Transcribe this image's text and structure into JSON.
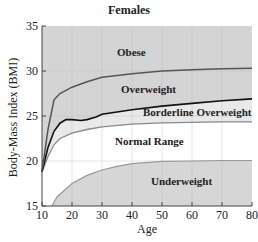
{
  "chart_data": {
    "type": "area",
    "title": "Females",
    "xlabel": "Age",
    "ylabel": "Body-Mass Index (BMI)",
    "xlim": [
      10,
      80
    ],
    "ylim": [
      15,
      35
    ],
    "x_ticks": [
      10,
      20,
      30,
      40,
      50,
      60,
      70,
      80
    ],
    "y_ticks": [
      15,
      20,
      25,
      30,
      35
    ],
    "grid": true,
    "series": [
      {
        "name": "Obese threshold",
        "x": [
          10,
          12,
          14,
          16,
          20,
          25,
          30,
          40,
          50,
          60,
          70,
          80
        ],
        "values": [
          18.8,
          23.5,
          26.8,
          27.5,
          28.2,
          28.8,
          29.3,
          29.7,
          30.0,
          30.15,
          30.25,
          30.3
        ]
      },
      {
        "name": "Overweight threshold",
        "x": [
          10,
          12,
          14,
          16,
          18,
          20,
          23,
          25,
          28,
          30,
          40,
          50,
          60,
          70,
          80
        ],
        "values": [
          18.8,
          21.5,
          23.3,
          24.2,
          24.6,
          24.6,
          24.5,
          24.6,
          24.9,
          25.2,
          25.7,
          26.1,
          26.4,
          26.7,
          26.9
        ]
      },
      {
        "name": "Borderline overweight threshold",
        "x": [
          10,
          12,
          14,
          16,
          20,
          25,
          30,
          40,
          50,
          60,
          70,
          80
        ],
        "values": [
          18.8,
          20.5,
          21.8,
          22.5,
          23.1,
          23.5,
          23.8,
          24.1,
          24.25,
          24.3,
          24.35,
          24.35
        ]
      },
      {
        "name": "Underweight threshold",
        "x": [
          13.3,
          15,
          20,
          25,
          30,
          35,
          40,
          50,
          60,
          70,
          80
        ],
        "values": [
          15.0,
          16.0,
          17.5,
          18.4,
          19.0,
          19.4,
          19.7,
          19.95,
          20.0,
          20.05,
          20.05
        ]
      }
    ],
    "regions": [
      "Obese",
      "Overweight",
      "Borderline Overweight",
      "Normal Range",
      "Underweight"
    ]
  },
  "labels": {
    "title": "Females",
    "xlabel": "Age",
    "ylabel": "Body-Mass Index (BMI)",
    "y_ticks": [
      "35",
      "30",
      "25",
      "20",
      "15"
    ],
    "x_ticks": [
      "10",
      "20",
      "30",
      "40",
      "50",
      "60",
      "70",
      "80"
    ],
    "regions": {
      "obese": "Obese",
      "overweight": "Overweight",
      "borderline": "Borderline Overweight",
      "normal": "Normal Range",
      "underweight": "Underweight"
    }
  },
  "colors": {
    "obese_fill": "#d4d4d4",
    "overweight_fill": "#d4d4d4",
    "borderline_fill": "#e9e9e9",
    "normal_fill": "#ffffff",
    "underweight_fill": "#d6d6d6",
    "obese_line": "#555555",
    "overweight_line": "#111111",
    "borderline_line": "#8a8a8a",
    "underweight_line": "#999999"
  }
}
